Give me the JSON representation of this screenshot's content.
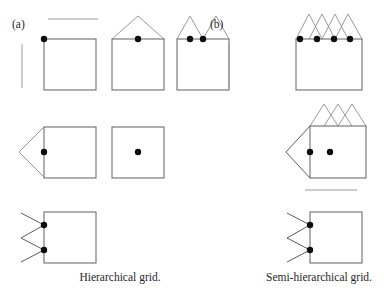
{
  "figure": {
    "background_color": "#ffffff",
    "stroke_color": "#6e6e6e",
    "branch_color": "#8e8e8e",
    "node_color": "#0d0d0d",
    "text_color": "#1f1f1f"
  },
  "panels": [
    {
      "id": "a",
      "label": "(a)",
      "caption": "Hierarchical grid."
    },
    {
      "id": "b",
      "label": "(b)",
      "caption": "Semi-hierarchical grid."
    }
  ],
  "diagram": {
    "panel_a": {
      "row1": {
        "rules": [
          {
            "name": "horizontal-rule",
            "x1": 48,
            "y1": 19,
            "x2": 98,
            "y2": 19
          },
          {
            "name": "vertical-rule",
            "x1": 22,
            "y1": 44,
            "x2": 22,
            "y2": 88
          }
        ],
        "cells": [
          {
            "name": "cell-flat-top",
            "box": {
              "x": 44,
              "y": 39,
              "w": 52,
              "h": 51
            },
            "branches": [],
            "nodes": [
              {
                "x": 44,
                "y": 39
              }
            ]
          },
          {
            "name": "cell-single-peak",
            "box": {
              "x": 112,
              "y": 39,
              "w": 52,
              "h": 51
            },
            "branches": [
              {
                "points": "112,39 138,16 164,39"
              }
            ],
            "nodes": [
              {
                "x": 138,
                "y": 39
              }
            ]
          },
          {
            "name": "cell-double-peak",
            "box": {
              "x": 177,
              "y": 39,
              "w": 52,
              "h": 51
            },
            "branches": [
              {
                "points": "177,39 190,16 203,39 216,16 229,39"
              }
            ],
            "nodes": [
              {
                "x": 190,
                "y": 39
              },
              {
                "x": 203,
                "y": 39
              }
            ]
          }
        ]
      },
      "row2": {
        "cells": [
          {
            "name": "cell-left-wedge",
            "box": {
              "x": 44,
              "y": 127,
              "w": 52,
              "h": 51
            },
            "branches": [
              {
                "points": "44,127 19,152 44,177"
              }
            ],
            "nodes": [
              {
                "x": 44,
                "y": 152
              }
            ]
          },
          {
            "name": "cell-center-node",
            "box": {
              "x": 112,
              "y": 127,
              "w": 52,
              "h": 51
            },
            "branches": [],
            "nodes": [
              {
                "x": 138,
                "y": 152
              }
            ]
          }
        ]
      },
      "row3": {
        "cells": [
          {
            "name": "cell-double-wedge",
            "box": {
              "x": 44,
              "y": 212,
              "w": 52,
              "h": 51
            },
            "branches": [
              {
                "points": "21,213 44,225 21,238 44,250 21,262"
              }
            ],
            "nodes": [
              {
                "x": 44,
                "y": 225
              },
              {
                "x": 44,
                "y": 250
              }
            ]
          }
        ]
      }
    },
    "panel_b": {
      "row1": {
        "rules": [
          {
            "name": "vertical-rule",
            "x1": 229,
            "y1": 44,
            "x2": 229,
            "y2": 88
          }
        ],
        "cells": [
          {
            "name": "cell-crossed-top-4nodes",
            "box": {
              "x": 296,
              "y": 39,
              "w": 66,
              "h": 51
            },
            "branches": [
              {
                "points": "296,39 309,14 322,39"
              },
              {
                "points": "309,39 322,14 335,39"
              },
              {
                "points": "322,39 335,14 348,39"
              },
              {
                "points": "335,39 348,14 362,39"
              }
            ],
            "nodes": [
              {
                "x": 300,
                "y": 39
              },
              {
                "x": 317,
                "y": 39
              },
              {
                "x": 334,
                "y": 39
              },
              {
                "x": 350,
                "y": 39
              }
            ]
          }
        ]
      },
      "row2": {
        "cells": [
          {
            "name": "cell-wedge-crossed-top",
            "box": {
              "x": 310,
              "y": 126,
              "w": 56,
              "h": 52
            },
            "branches": [
              {
                "points": "310,126 324,104 338,126"
              },
              {
                "points": "324,126 338,104 352,126"
              },
              {
                "points": "338,126 352,104 366,126"
              },
              {
                "points": "310,126 286,152 310,178"
              }
            ],
            "nodes": [
              {
                "x": 310,
                "y": 152
              },
              {
                "x": 330,
                "y": 152
              }
            ]
          }
        ]
      },
      "row3": {
        "rules": [
          {
            "name": "horizontal-rule",
            "x1": 305,
            "y1": 190,
            "x2": 357,
            "y2": 190
          }
        ],
        "cells": [
          {
            "name": "cell-double-wedge",
            "box": {
              "x": 310,
              "y": 212,
              "w": 52,
              "h": 51
            },
            "branches": [
              {
                "points": "287,213 310,225 287,238 310,250 287,262"
              }
            ],
            "nodes": [
              {
                "x": 310,
                "y": 225
              },
              {
                "x": 310,
                "y": 250
              }
            ]
          }
        ]
      }
    }
  },
  "labels": {
    "panel_a_label_pos": {
      "x": 12,
      "y": 28
    },
    "panel_b_label_pos": {
      "x": 210,
      "y": 28
    },
    "caption_a_pos": {
      "x": 120,
      "y": 281
    },
    "caption_b_pos": {
      "x": 319,
      "y": 281
    }
  }
}
